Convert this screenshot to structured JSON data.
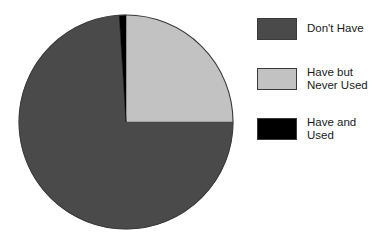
{
  "chart_data": {
    "type": "pie",
    "title": "",
    "subtitle": "",
    "xlabel": "",
    "ylabel": "",
    "grid": false,
    "legend_position": "right",
    "start_angle_deg": 0,
    "direction": "clockwise",
    "categories": [
      "Don't Have",
      "Have but Never Used",
      "Have and Used"
    ],
    "values": [
      74,
      25,
      1
    ],
    "units": "percent",
    "slices": [
      {
        "label": "Don't Have",
        "value": 74,
        "color": "#4a4a4a",
        "start_angle_deg": 90,
        "end_angle_deg": 356
      },
      {
        "label": "Have but Never Used",
        "value": 25,
        "color": "#c2c2c2",
        "start_angle_deg": 0,
        "end_angle_deg": 90
      },
      {
        "label": "Have and Used",
        "value": 1,
        "color": "#000000",
        "start_angle_deg": 356,
        "end_angle_deg": 360
      }
    ]
  },
  "legend": {
    "items": [
      {
        "label": "Don't Have",
        "color": "#4a4a4a",
        "swatch_name": "legend-swatch-dont-have"
      },
      {
        "label": "Have but\nNever Used",
        "color": "#c2c2c2",
        "swatch_name": "legend-swatch-have-but-never-used"
      },
      {
        "label": "Have and\nUsed",
        "color": "#000000",
        "swatch_name": "legend-swatch-have-and-used"
      }
    ]
  },
  "pie_geometry": {
    "center_x": 126,
    "center_y": 122,
    "radius": 107,
    "outline_color": "#3a3a3a"
  }
}
